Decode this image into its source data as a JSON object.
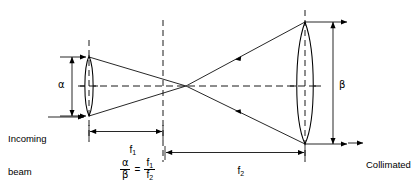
{
  "diagram": {
    "type": "optical-ray-diagram",
    "background_color": "#ffffff",
    "line_color": "#000000",
    "labels": {
      "alpha": "α",
      "beta": "β",
      "f1": "f",
      "f1_sub": "1",
      "f2": "f",
      "f2_sub": "2",
      "incoming_line1": "Incoming",
      "incoming_line2": "beam",
      "collimated_line1": "Collimated",
      "collimated_line2": "(expanded)",
      "collimated_line3": "beam"
    },
    "formula": {
      "num_left": "α",
      "den_left": "β",
      "equals": "=",
      "num_right": "f",
      "num_right_sub": "1",
      "den_right": "f",
      "den_right_sub": "2"
    },
    "geometry": {
      "optical_axis_y": 86,
      "lens1_x": 89,
      "lens1_half_height": 30,
      "lens2_x": 305,
      "lens2_half_height": 61,
      "focal_point_x": 186,
      "dashed_vert_1_x": 89,
      "dashed_vert_2_x": 163,
      "dashed_vert_3_x": 305,
      "alpha_dim_x": 72,
      "alpha_dim_top": 57,
      "alpha_dim_bottom": 117,
      "beta_dim_x": 333,
      "beta_dim_top": 22,
      "beta_dim_bottom": 143,
      "f1_dim_y": 131,
      "f1_dim_left": 89,
      "f1_dim_right": 163,
      "f2_dim_y": 152,
      "f2_dim_left": 165,
      "f2_dim_right": 305
    }
  }
}
